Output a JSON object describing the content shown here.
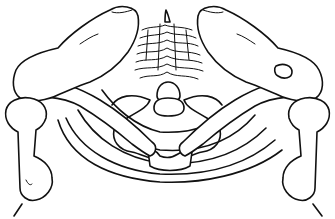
{
  "figure": {
    "colors": {
      "line": "#111111",
      "background": "#ffffff"
    },
    "parts": [
      "left-scapula",
      "right-scapula",
      "left-clavicle",
      "right-clavicle",
      "left-humerus",
      "right-humerus",
      "vertebral-column",
      "first-rib-pair",
      "rib-arcs",
      "sternum-manubrium"
    ]
  }
}
